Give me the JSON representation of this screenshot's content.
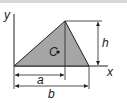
{
  "diagram": {
    "type": "triangle-centroid",
    "labels": {
      "y_axis": "y",
      "x_axis": "x",
      "centroid": "C",
      "height": "h",
      "apex_offset": "a",
      "base": "b"
    },
    "colors": {
      "fill": "#a6a6a6",
      "line": "#222222"
    }
  }
}
